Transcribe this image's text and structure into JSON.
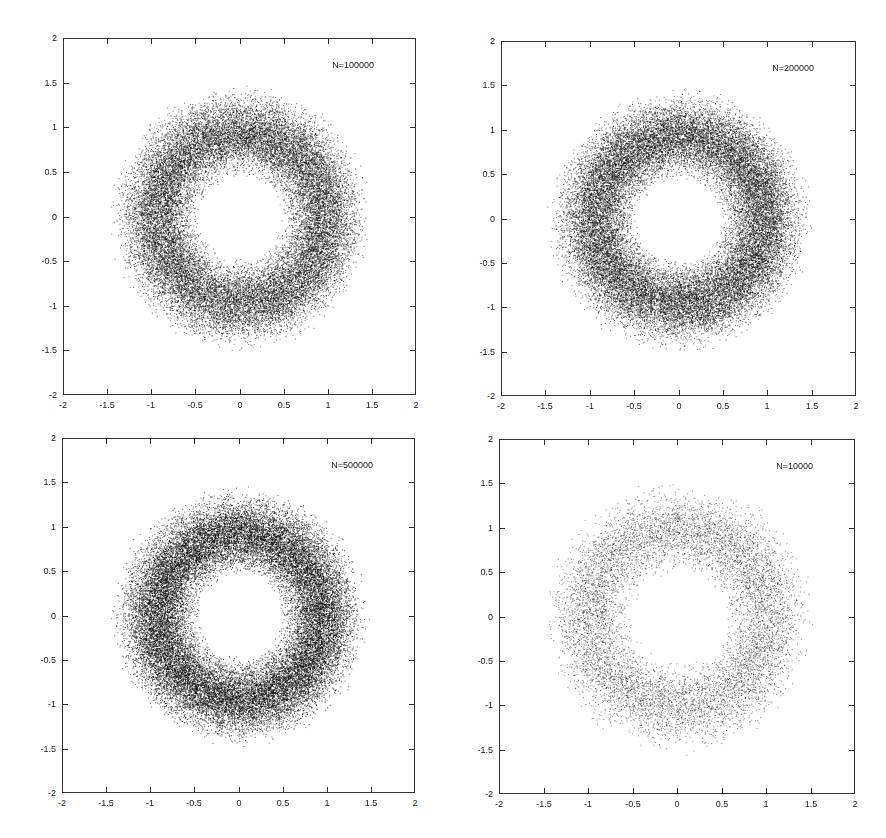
{
  "chart_data": [
    {
      "type": "scatter",
      "title": "",
      "legend": "N=100000",
      "n_points": 100000,
      "xlabel": "",
      "ylabel": "",
      "xlim": [
        -2,
        2
      ],
      "ylim": [
        -2,
        2
      ],
      "xticks": [
        "-2",
        "-1.5",
        "-1",
        "-0.5",
        "0",
        "0.5",
        "1",
        "1.5",
        "2"
      ],
      "yticks": [
        "2",
        "1.5",
        "1",
        "0.5",
        "0",
        "-0.5",
        "-1",
        "-1.5",
        "-2"
      ],
      "grid": false,
      "legend_position": "top-right",
      "distribution": {
        "shape": "annulus",
        "center": [
          0,
          0
        ],
        "inner_radius": 0.5,
        "peak_radius": 1.0,
        "outer_radius": 1.45
      },
      "frame": {
        "left": 63,
        "top": 38,
        "width": 353,
        "height": 357
      },
      "render_points": 26000,
      "dot_alpha": 0.55
    },
    {
      "type": "scatter",
      "title": "",
      "legend": "N=200000",
      "n_points": 200000,
      "xlabel": "",
      "ylabel": "",
      "xlim": [
        -2,
        2
      ],
      "ylim": [
        -2,
        2
      ],
      "xticks": [
        "-2",
        "-1.5",
        "-1",
        "-0.5",
        "0",
        "0.5",
        "1",
        "1.5",
        "2"
      ],
      "yticks": [
        "2",
        "1.5",
        "1",
        "0.5",
        "0",
        "-0.5",
        "-1",
        "-1.5",
        "-2"
      ],
      "grid": false,
      "legend_position": "top-right",
      "distribution": {
        "shape": "annulus",
        "center": [
          0,
          0
        ],
        "inner_radius": 0.5,
        "peak_radius": 1.0,
        "outer_radius": 1.45
      },
      "frame": {
        "left": 501,
        "top": 41,
        "width": 355,
        "height": 355
      },
      "render_points": 28000,
      "dot_alpha": 0.55
    },
    {
      "type": "scatter",
      "title": "",
      "legend": "N=500000",
      "n_points": 500000,
      "xlabel": "",
      "ylabel": "",
      "xlim": [
        -2,
        2
      ],
      "ylim": [
        -2,
        2
      ],
      "xticks": [
        "-2",
        "-1.5",
        "-1",
        "-0.5",
        "0",
        "0.5",
        "1",
        "1.5",
        "2"
      ],
      "yticks": [
        "2",
        "1.5",
        "1",
        "0.5",
        "0",
        "-0.5",
        "-1",
        "-1.5",
        "-2"
      ],
      "grid": false,
      "legend_position": "top-right",
      "distribution": {
        "shape": "annulus",
        "center": [
          0,
          0
        ],
        "inner_radius": 0.5,
        "peak_radius": 1.0,
        "outer_radius": 1.42
      },
      "frame": {
        "left": 62,
        "top": 438,
        "width": 353,
        "height": 355
      },
      "render_points": 30000,
      "dot_alpha": 0.6
    },
    {
      "type": "scatter",
      "title": "",
      "legend": "N=10000",
      "n_points": 10000,
      "xlabel": "",
      "ylabel": "",
      "xlim": [
        -2,
        2
      ],
      "ylim": [
        -2,
        2
      ],
      "xticks": [
        "-2",
        "-1.5",
        "-1",
        "-0.5",
        "0",
        "0.5",
        "1",
        "1.5",
        "2"
      ],
      "yticks": [
        "2",
        "1.5",
        "1",
        "0.5",
        "0",
        "-0.5",
        "-1",
        "-1.5",
        "-2"
      ],
      "grid": false,
      "legend_position": "top-right",
      "distribution": {
        "shape": "annulus",
        "center": [
          0,
          0
        ],
        "inner_radius": 0.55,
        "peak_radius": 1.0,
        "outer_radius": 1.5
      },
      "frame": {
        "left": 499,
        "top": 439,
        "width": 356,
        "height": 355
      },
      "render_points": 9000,
      "dot_alpha": 0.45
    }
  ]
}
